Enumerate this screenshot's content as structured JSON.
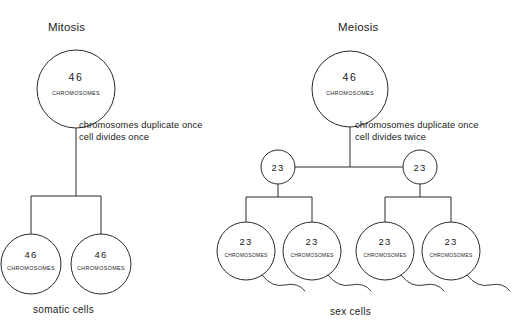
{
  "diagram": {
    "title_mitosis": "Mitosis",
    "title_meiosis": "Meiosis",
    "footer_somatic": "somatic cells",
    "footer_sex": "sex cells",
    "stroke_color": "#2a2a2a",
    "text_color": "#222222",
    "background": "#ffffff"
  },
  "mitosis": {
    "parent": {
      "count": "46",
      "unit": "CHROMOSOMES"
    },
    "description": {
      "line1": "chromosomes duplicate once",
      "line2": "cell divides once"
    },
    "daughters": [
      {
        "count": "46",
        "unit": "CHROMOSOMES"
      },
      {
        "count": "46",
        "unit": "CHROMOSOMES"
      }
    ],
    "footer": "somatic cells"
  },
  "meiosis": {
    "parent": {
      "count": "46",
      "unit": "CHROMOSOMES"
    },
    "description": {
      "line1": "chromosomes duplicate once",
      "line2": "cell divides twice"
    },
    "intermediates": [
      {
        "count": "23"
      },
      {
        "count": "23"
      }
    ],
    "gametes": [
      {
        "count": "23",
        "unit": "CHROMOSOMES"
      },
      {
        "count": "23",
        "unit": "CHROMOSOMES"
      },
      {
        "count": "23",
        "unit": "CHROMOSOMES"
      },
      {
        "count": "23",
        "unit": "CHROMOSOMES"
      }
    ],
    "footer": "sex cells"
  }
}
